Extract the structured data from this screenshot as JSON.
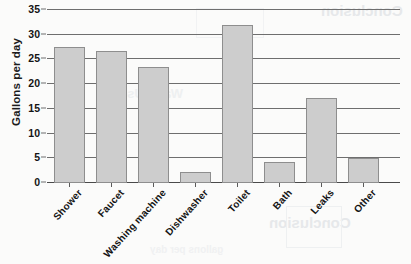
{
  "chart_data": {
    "type": "bar",
    "title": "",
    "xlabel": "",
    "ylabel": "Gallons per day",
    "ylim": [
      0,
      35
    ],
    "yticks": [
      0,
      5,
      10,
      15,
      20,
      25,
      30,
      35
    ],
    "ytick_labels": [
      "0",
      "5",
      "10",
      "15",
      "20",
      "25",
      "30",
      "35"
    ],
    "grid": true,
    "legend": false,
    "categories": [
      "Shower",
      "Faucet",
      "Washing machine",
      "Dishwasher",
      "Toilet",
      "Bath",
      "Leaks",
      "Other"
    ],
    "values": [
      27.5,
      26.8,
      23.5,
      2.2,
      32.0,
      4.3,
      17.1,
      5.0
    ],
    "bar_color": "#cdcdcd",
    "bar_edge_color": "#8e8e8e",
    "grid_color": "#6e6e6e",
    "background_color": "#fbfbfa"
  },
  "artifacts": {
    "bleed_top": "Conclusion",
    "bleed_bottom": "Conclusion",
    "bleed_faint_a": "Water Use",
    "bleed_faint_b": "gallons per day"
  }
}
